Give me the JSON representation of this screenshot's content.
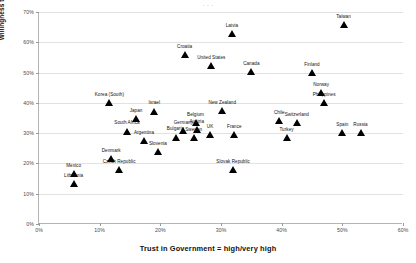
{
  "figure": {
    "cropped_header": "· · ·",
    "x_axis_title": "Trust in Government = high/very high",
    "y_axis_title": "Willingness to pay = high/very high"
  },
  "chart_data": {
    "type": "scatter",
    "title": "",
    "xlabel": "Trust in Government = high/very high",
    "ylabel": "Willingness to pay = high/very high",
    "xlim": [
      0,
      60
    ],
    "ylim": [
      0,
      70
    ],
    "xticks": [
      "0%",
      "10%",
      "20%",
      "30%",
      "40%",
      "50%",
      "60%"
    ],
    "yticks": [
      "0%",
      "10%",
      "20%",
      "30%",
      "40%",
      "50%",
      "60%",
      "70%"
    ],
    "xtick_values": [
      0,
      10,
      20,
      30,
      40,
      50,
      60
    ],
    "ytick_values": [
      0,
      10,
      20,
      30,
      40,
      50,
      60,
      70
    ],
    "grid": "horizontal",
    "legend": "none",
    "marker": "triangle",
    "marker_color": "#000000",
    "points": [
      {
        "label": "Taiwan",
        "x": 50.2,
        "y": 65.8
      },
      {
        "label": "Latvia",
        "x": 31.8,
        "y": 62.8
      },
      {
        "label": "Croatia",
        "x": 24.0,
        "y": 56.0
      },
      {
        "label": "United States",
        "x": 28.4,
        "y": 52.2
      },
      {
        "label": "Canada",
        "x": 35.0,
        "y": 50.3
      },
      {
        "label": "Finland",
        "x": 45.0,
        "y": 50.0
      },
      {
        "label": "Norway",
        "x": 46.5,
        "y": 43.5
      },
      {
        "label": "Korea (South)",
        "x": 11.6,
        "y": 40.0
      },
      {
        "label": "Israel",
        "x": 19.0,
        "y": 37.3
      },
      {
        "label": "New Zealand",
        "x": 30.2,
        "y": 37.5
      },
      {
        "label": "Philippines",
        "x": 47.0,
        "y": 40.2
      },
      {
        "label": "Japan",
        "x": 16.0,
        "y": 34.8
      },
      {
        "label": "Belgium",
        "x": 25.8,
        "y": 33.5
      },
      {
        "label": "Chile",
        "x": 39.6,
        "y": 34.2
      },
      {
        "label": "Switzerland",
        "x": 42.5,
        "y": 33.5
      },
      {
        "label": "Germany",
        "x": 23.8,
        "y": 31.0
      },
      {
        "label": "Austria",
        "x": 26.0,
        "y": 31.2
      },
      {
        "label": "South Africa",
        "x": 14.5,
        "y": 30.7
      },
      {
        "label": "Spain",
        "x": 50.0,
        "y": 30.2
      },
      {
        "label": "Russia",
        "x": 53.0,
        "y": 30.2
      },
      {
        "label": "UK",
        "x": 28.2,
        "y": 29.5
      },
      {
        "label": "France",
        "x": 32.2,
        "y": 29.5
      },
      {
        "label": "Bulgaria",
        "x": 22.5,
        "y": 28.7
      },
      {
        "label": "Sweden",
        "x": 25.5,
        "y": 28.6
      },
      {
        "label": "Turkey",
        "x": 40.8,
        "y": 28.5
      },
      {
        "label": "Argentina",
        "x": 17.3,
        "y": 27.5
      },
      {
        "label": "Slovenia",
        "x": 19.6,
        "y": 24.0
      },
      {
        "label": "Denmark",
        "x": 11.9,
        "y": 21.5
      },
      {
        "label": "Slovak Republic",
        "x": 32.0,
        "y": 18.0
      },
      {
        "label": "Czech Republic",
        "x": 13.2,
        "y": 18.0
      },
      {
        "label": "Mexico",
        "x": 5.7,
        "y": 16.8
      },
      {
        "label": "Lithuania",
        "x": 5.7,
        "y": 13.4
      }
    ]
  }
}
